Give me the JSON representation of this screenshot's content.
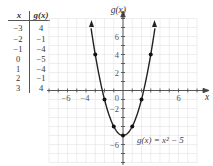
{
  "figure": {
    "table": {
      "headers": [
        "x",
        "g(x)"
      ],
      "rows": [
        {
          "x": "−3",
          "g": "4"
        },
        {
          "x": "−2",
          "g": "−1"
        },
        {
          "x": "−1",
          "g": "−4"
        },
        {
          "x": "0",
          "g": "−5"
        },
        {
          "x": "1",
          "g": "−4"
        },
        {
          "x": "2",
          "g": "−1"
        },
        {
          "x": "3",
          "g": "4"
        }
      ]
    },
    "graph": {
      "y_axis_label": "g(x)",
      "x_axis_label": "x",
      "equation_label": "g(x) = x² − 5",
      "x_tick_labels": [
        {
          "value": -6,
          "text": "−6"
        },
        {
          "value": -4,
          "text": "−4"
        },
        {
          "value": 6,
          "text": "6"
        }
      ],
      "y_tick_labels": [
        {
          "value": 6,
          "text": "6"
        },
        {
          "value": 4,
          "text": "4"
        },
        {
          "value": 2,
          "text": "2"
        },
        {
          "value": -2,
          "text": "−2"
        },
        {
          "value": -6,
          "text": "−6"
        }
      ],
      "origin_label": "0"
    }
  },
  "chart_data": {
    "type": "line",
    "title": "",
    "xlabel": "x",
    "ylabel": "g(x)",
    "function": "g(x) = x^2 - 5",
    "x": [
      -3,
      -2,
      -1,
      0,
      1,
      2,
      3
    ],
    "values": [
      4,
      -1,
      -4,
      -5,
      -4,
      -1,
      4
    ],
    "series": [
      {
        "name": "g(x) = x^2 - 5",
        "x": [
          -3,
          -2,
          -1,
          0,
          1,
          2,
          3
        ],
        "values": [
          4,
          -1,
          -4,
          -5,
          -4,
          -1,
          4
        ]
      }
    ],
    "xlim": [
      -8,
      8
    ],
    "ylim": [
      -8,
      8
    ],
    "x_ticks_labeled": [
      -6,
      -4,
      6
    ],
    "y_ticks_labeled": [
      6,
      4,
      2,
      -2,
      -6
    ],
    "grid": true,
    "legend": "none",
    "annotations": [
      "g(x) = x^2 - 5"
    ]
  }
}
